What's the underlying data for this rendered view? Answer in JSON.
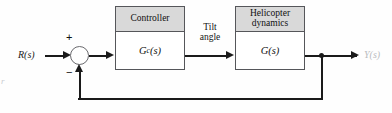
{
  "diagram": {
    "type": "control-system-block-diagram",
    "input_label": "R(s)",
    "output_label": "Y(s)",
    "intermediate_label_line1": "Tilt",
    "intermediate_label_line2": "angle",
    "summing_junction": {
      "plus_sign": "+",
      "minus_sign": "−"
    },
    "blocks": [
      {
        "name": "controller",
        "header": "Controller",
        "body_symbol": "G",
        "body_subscript": "c",
        "body_suffix": "(s)"
      },
      {
        "name": "helicopter-dynamics",
        "header_line1": "Helicopter",
        "header_line2": "dynamics",
        "body_symbol": "G",
        "body_suffix": "(s)"
      }
    ],
    "edge_artifact": "r",
    "colors": {
      "line": "#1a1a1a",
      "block_border": "#55565a",
      "block_header_fill": "#d9d9d9",
      "block_body_fill": "#ffffff",
      "background": "#ffffff"
    }
  }
}
